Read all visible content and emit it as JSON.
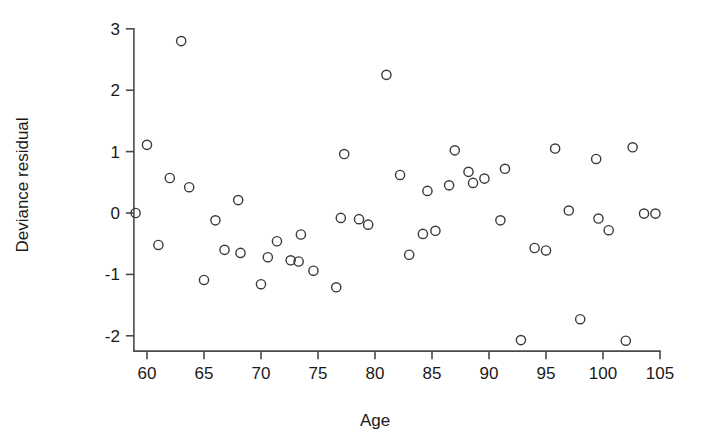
{
  "chart_data": {
    "type": "scatter",
    "title": "",
    "xlabel": "Age",
    "ylabel": "Deviance residual",
    "xlim": [
      58.5,
      105.5
    ],
    "ylim": [
      -2.25,
      3.05
    ],
    "xticks": [
      60,
      65,
      70,
      75,
      80,
      85,
      90,
      95,
      100,
      105
    ],
    "yticks": [
      -2,
      -1,
      0,
      1,
      2,
      3
    ],
    "xtick_labels": [
      "60",
      "65",
      "70",
      "75",
      "80",
      "85",
      "90",
      "95",
      "100",
      "105"
    ],
    "ytick_labels": [
      "-2",
      "-1",
      "0",
      "1",
      "2",
      "3"
    ],
    "grid": false,
    "legend": null,
    "marker": "open-circle",
    "marker_color": "#3a3a3a",
    "points": [
      {
        "x": 59.0,
        "y": 0.0
      },
      {
        "x": 60.0,
        "y": 1.11
      },
      {
        "x": 61.0,
        "y": -0.52
      },
      {
        "x": 62.0,
        "y": 0.57
      },
      {
        "x": 63.0,
        "y": 2.8
      },
      {
        "x": 63.7,
        "y": 0.42
      },
      {
        "x": 65.0,
        "y": -1.09
      },
      {
        "x": 66.0,
        "y": -0.12
      },
      {
        "x": 66.8,
        "y": -0.6
      },
      {
        "x": 68.0,
        "y": 0.21
      },
      {
        "x": 68.2,
        "y": -0.65
      },
      {
        "x": 70.0,
        "y": -1.16
      },
      {
        "x": 70.6,
        "y": -0.72
      },
      {
        "x": 71.4,
        "y": -0.46
      },
      {
        "x": 72.6,
        "y": -0.77
      },
      {
        "x": 73.3,
        "y": -0.79
      },
      {
        "x": 73.5,
        "y": -0.35
      },
      {
        "x": 74.6,
        "y": -0.94
      },
      {
        "x": 76.6,
        "y": -1.21
      },
      {
        "x": 77.0,
        "y": -0.08
      },
      {
        "x": 77.3,
        "y": 0.96
      },
      {
        "x": 78.6,
        "y": -0.1
      },
      {
        "x": 79.4,
        "y": -0.19
      },
      {
        "x": 81.0,
        "y": 2.25
      },
      {
        "x": 82.2,
        "y": 0.62
      },
      {
        "x": 83.0,
        "y": -0.68
      },
      {
        "x": 84.2,
        "y": -0.34
      },
      {
        "x": 84.6,
        "y": 0.36
      },
      {
        "x": 85.3,
        "y": -0.29
      },
      {
        "x": 86.5,
        "y": 0.45
      },
      {
        "x": 87.0,
        "y": 1.02
      },
      {
        "x": 88.2,
        "y": 0.67
      },
      {
        "x": 88.6,
        "y": 0.49
      },
      {
        "x": 89.6,
        "y": 0.56
      },
      {
        "x": 91.0,
        "y": -0.12
      },
      {
        "x": 91.4,
        "y": 0.72
      },
      {
        "x": 92.8,
        "y": -2.07
      },
      {
        "x": 94.0,
        "y": -0.57
      },
      {
        "x": 95.0,
        "y": -0.61
      },
      {
        "x": 95.8,
        "y": 1.05
      },
      {
        "x": 97.0,
        "y": 0.04
      },
      {
        "x": 98.0,
        "y": -1.73
      },
      {
        "x": 99.4,
        "y": 0.88
      },
      {
        "x": 99.6,
        "y": -0.09
      },
      {
        "x": 100.5,
        "y": -0.28
      },
      {
        "x": 102.0,
        "y": -2.08
      },
      {
        "x": 102.6,
        "y": 1.07
      },
      {
        "x": 103.6,
        "y": -0.01
      },
      {
        "x": 104.6,
        "y": -0.01
      }
    ]
  },
  "axes": {
    "x_axis_label": "Age",
    "y_axis_label": "Deviance residual"
  }
}
